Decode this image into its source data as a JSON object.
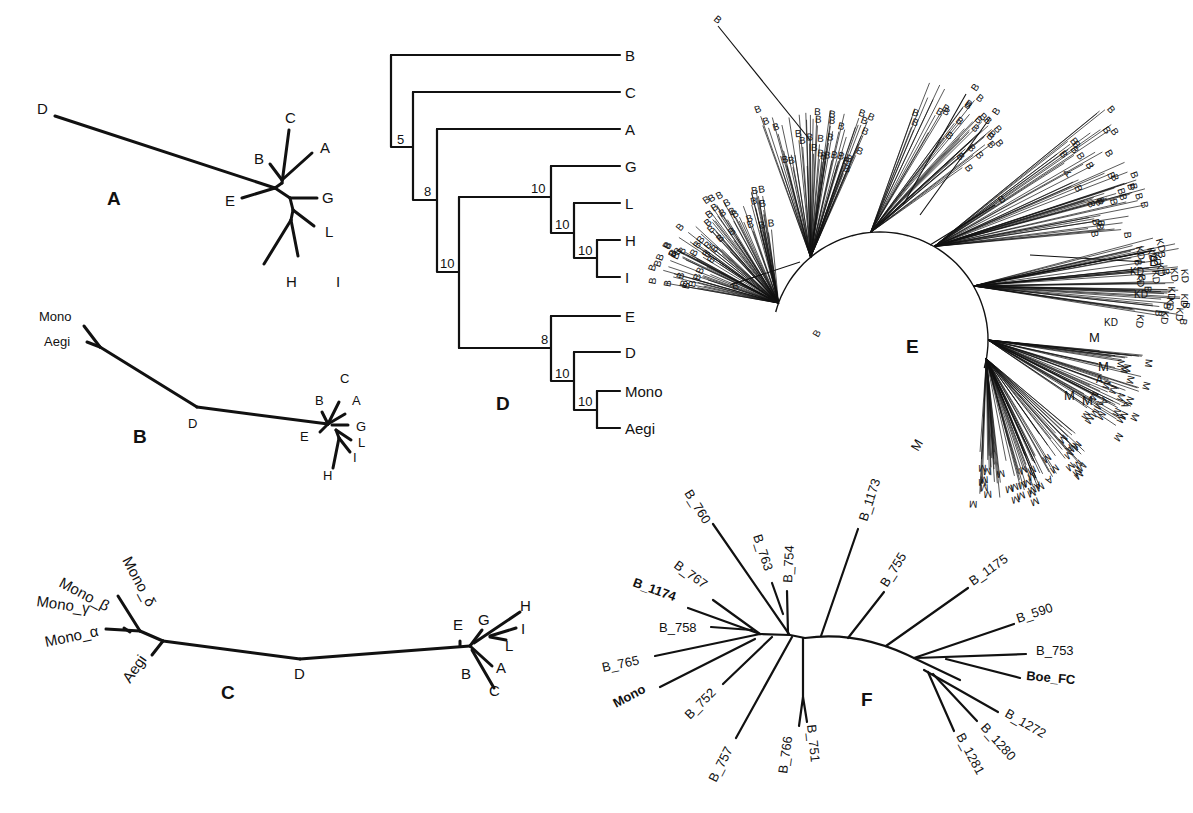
{
  "figure": {
    "panels": {
      "A": {
        "label": "A",
        "type": "unrooted-tree",
        "taxa": {
          "D": "D",
          "C": "C",
          "B": "B",
          "A": "A",
          "E": "E",
          "G": "G",
          "L": "L",
          "H": "H",
          "I": "I"
        }
      },
      "B": {
        "label": "B",
        "type": "unrooted-tree",
        "taxa": {
          "Mono": "Mono",
          "Aegi": "Aegi",
          "D": "D",
          "C": "C",
          "B": "B",
          "A": "A",
          "E": "E",
          "G": "G",
          "L": "L",
          "I": "I",
          "H": "H"
        }
      },
      "C": {
        "label": "C",
        "type": "unrooted-tree",
        "taxa": {
          "Mono_delta": "Mono_δ",
          "Mono_beta": "Mono_β",
          "Mono_gamma": "Mono_γ",
          "Mono_alpha": "Mono_α",
          "Aegi": "Aegi",
          "D": "D",
          "E": "E",
          "G": "G",
          "H": "H",
          "I": "I",
          "L": "L",
          "A": "A",
          "B": "B",
          "C": "C"
        }
      },
      "D": {
        "label": "D",
        "type": "rooted-cladogram",
        "taxa": [
          "B",
          "C",
          "A",
          "G",
          "L",
          "H",
          "I",
          "E",
          "D",
          "Mono",
          "Aegi"
        ],
        "bootstrap": {
          "n5": "5",
          "n8a": "8",
          "n10a": "10",
          "n10b": "10",
          "n10c": "10",
          "n10d": "10",
          "n8b": "8",
          "n10e": "10",
          "n10f": "10"
        }
      },
      "E": {
        "label": "E",
        "type": "radial-tree-dense",
        "leaf_labels": [
          "B",
          "A",
          "D",
          "KD",
          "M"
        ],
        "sample_labels": {
          "b1": "B",
          "b2": "B",
          "b3": "B",
          "b4": "B",
          "b5": "B",
          "b6": "B",
          "b7": "B",
          "a1": "A",
          "a2": "A",
          "kd1": "KD",
          "kd2": "KD",
          "kd3": "KD",
          "m1": "M",
          "m2": "M",
          "m3": "M",
          "m4": "M",
          "m5": "M"
        }
      },
      "F": {
        "label": "F",
        "type": "unrooted-tree",
        "taxa": {
          "B_760": "B_760",
          "B_763": "B_763",
          "B_754": "B_754",
          "B_1173": "B_1173",
          "B_767": "B_767",
          "B_1174": "B_1174",
          "B_758": "B_758",
          "B_765": "B_765",
          "Mono": "Mono",
          "B_752": "B_752",
          "B_757": "B_757",
          "B_766": "B_766",
          "B_751": "B_751",
          "B_755": "B_755",
          "B_1175": "B_1175",
          "B_590": "B_590",
          "B_753": "B_753",
          "Boe_FC": "Boe_FC",
          "B_1272": "B_1272",
          "B_1280": "B_1280",
          "B_1281": "B_1281"
        }
      }
    }
  }
}
